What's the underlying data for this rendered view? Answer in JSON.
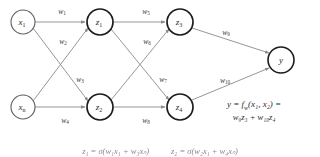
{
  "diagram": {
    "colors": {
      "background": "#ffffff",
      "edge": "#8a8a8a",
      "node_stroke_strong": "#1c1c1c",
      "node_stroke_light": "#5f5f5f",
      "text": "#2b2b2b"
    },
    "layers": [
      {
        "name": "input-layer",
        "nodes": [
          {
            "id": "x1",
            "base": "x",
            "sub": "1",
            "cx": 23,
            "cy": 22,
            "r": 12,
            "style": "node-input"
          },
          {
            "id": "xn",
            "base": "x",
            "sub": "n",
            "cx": 23,
            "cy": 107,
            "r": 12,
            "style": "node-input"
          }
        ]
      },
      {
        "name": "hidden-layer-1",
        "nodes": [
          {
            "id": "z1",
            "base": "z",
            "sub": "1",
            "cx": 100,
            "cy": 22,
            "r": 13,
            "style": "node-hidden"
          },
          {
            "id": "z2",
            "base": "z",
            "sub": "2",
            "cx": 100,
            "cy": 107,
            "r": 13,
            "style": "node-hidden"
          }
        ]
      },
      {
        "name": "hidden-layer-2",
        "nodes": [
          {
            "id": "z3",
            "base": "z",
            "sub": "3",
            "cx": 180,
            "cy": 22,
            "r": 13,
            "style": "node-hidden"
          },
          {
            "id": "z4",
            "base": "z",
            "sub": "4",
            "cx": 180,
            "cy": 107,
            "r": 13,
            "style": "node-hidden"
          }
        ]
      },
      {
        "name": "output-layer",
        "nodes": [
          {
            "id": "y",
            "base": "y",
            "sub": "",
            "cx": 281,
            "cy": 60,
            "r": 13,
            "style": "node-output"
          }
        ]
      }
    ],
    "edges": [
      {
        "id": "e-x1-z1",
        "from": "x1",
        "to": "z1",
        "weight": "w1"
      },
      {
        "id": "e-x1-z2",
        "from": "x1",
        "to": "z2",
        "weight": "w2"
      },
      {
        "id": "e-xn-z1",
        "from": "xn",
        "to": "z1",
        "weight": "w3"
      },
      {
        "id": "e-xn-z2",
        "from": "xn",
        "to": "z2",
        "weight": "w4"
      },
      {
        "id": "e-z1-z3",
        "from": "z1",
        "to": "z3",
        "weight": "w5"
      },
      {
        "id": "e-z1-z4",
        "from": "z1",
        "to": "z4",
        "weight": "w6"
      },
      {
        "id": "e-z2-z3",
        "from": "z2",
        "to": "z3",
        "weight": "w7"
      },
      {
        "id": "e-z2-z4",
        "from": "z2",
        "to": "z4",
        "weight": "w8"
      },
      {
        "id": "e-z3-y",
        "from": "z3",
        "to": "y",
        "weight": "w9"
      },
      {
        "id": "e-z4-y",
        "from": "z4",
        "to": "y",
        "weight": "w10"
      }
    ],
    "weights": [
      {
        "id": "w1",
        "base": "w",
        "sub": "1",
        "x": 62,
        "y": 11
      },
      {
        "id": "w2",
        "base": "w",
        "sub": "2",
        "x": 63,
        "y": 41
      },
      {
        "id": "w3",
        "base": "w",
        "sub": "3",
        "x": 80,
        "y": 79
      },
      {
        "id": "w4",
        "base": "w",
        "sub": "4",
        "x": 65,
        "y": 120
      },
      {
        "id": "w5",
        "base": "w",
        "sub": "5",
        "x": 146,
        "y": 11
      },
      {
        "id": "w6",
        "base": "w",
        "sub": "6",
        "x": 147,
        "y": 41
      },
      {
        "id": "w7",
        "base": "w",
        "sub": "7",
        "x": 163,
        "y": 79
      },
      {
        "id": "w8",
        "base": "w",
        "sub": "8",
        "x": 146,
        "y": 120
      },
      {
        "id": "w9",
        "base": "w",
        "sub": "9",
        "x": 226,
        "y": 32
      },
      {
        "id": "w10",
        "base": "w",
        "sub": "10",
        "x": 225,
        "y": 80
      }
    ]
  },
  "equation": {
    "line1_prefix": "y = f",
    "line1_sub": "w",
    "line1_args": "(x₁, x₂) =",
    "line2": "w₉z₃ + w₁₀z₄",
    "full_text": "y = f_w(x1, x2) = w9 z3 + w10 z4"
  },
  "bottom_equations": {
    "visible": true,
    "note": "partially-cropped-row",
    "items": [
      "z₁ = σ(w₁x₁ + w₃xₙ)",
      "z₂ = σ(w₂x₁ + w₄xₙ)"
    ]
  }
}
